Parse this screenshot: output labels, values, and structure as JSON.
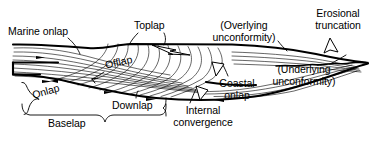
{
  "figure": {
    "kind": "seismic-stratigraphy-terminology-diagram",
    "background_color": "#ffffff",
    "line_color": "#000000",
    "labels": [
      {
        "id": "marine-onlap",
        "text": "Marine onlap",
        "x": 8,
        "y": 26
      },
      {
        "id": "toplap",
        "text": "Toplap",
        "x": 134,
        "y": 20
      },
      {
        "id": "overlying-unconformity",
        "text": "(Overlying\nunconformity)",
        "x": 208,
        "y": 20
      },
      {
        "id": "erosional-truncation",
        "text": "Erosional\ntruncation",
        "x": 311,
        "y": 8
      },
      {
        "id": "offlap",
        "text": "Offlap",
        "x": 104,
        "y": 58
      },
      {
        "id": "underlying-unconformity",
        "text": "(Underlying\nunconformity)",
        "x": 266,
        "y": 64
      },
      {
        "id": "coastal-onlap",
        "text": "Coastal\nonlap",
        "x": 218,
        "y": 78
      },
      {
        "id": "onlap",
        "text": "Onlap",
        "x": 31,
        "y": 86
      },
      {
        "id": "downlap",
        "text": "Downlap",
        "x": 112,
        "y": 100
      },
      {
        "id": "internal-convergence",
        "text": "Internal\nconvergence",
        "x": 176,
        "y": 105
      },
      {
        "id": "baselap",
        "text": "Baselap",
        "x": 48,
        "y": 118
      }
    ]
  }
}
